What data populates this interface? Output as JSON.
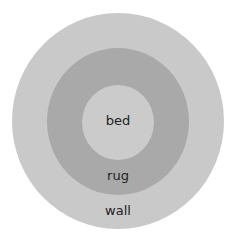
{
  "diagram": {
    "type": "concentric-circles",
    "layers": [
      {
        "label": "wall",
        "color": "#c9c9c9"
      },
      {
        "label": "rug",
        "color": "#a9a9a9"
      },
      {
        "label": "bed",
        "color": "#cbcbcb"
      }
    ]
  }
}
